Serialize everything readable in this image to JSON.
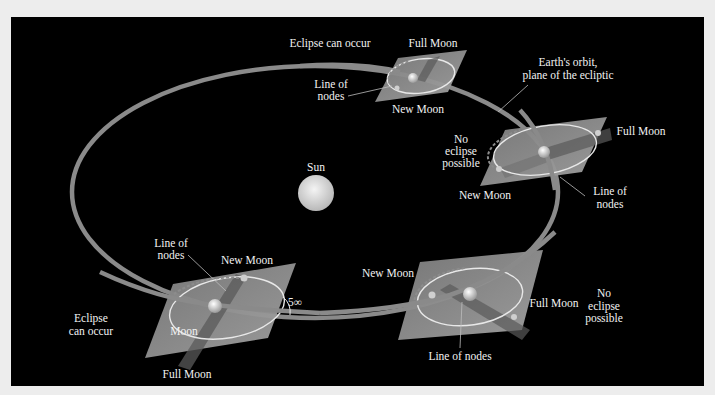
{
  "diagram": {
    "colors": {
      "background": "#ededed",
      "panel": "#000000",
      "orbit": "#8a8a8a",
      "plane": "#8c8c8c",
      "label": "#f2f2f2"
    },
    "sun": {
      "label": "Sun"
    },
    "orbit_label": {
      "line1": "Earth's orbit,",
      "line2": "plane of the ecliptic"
    },
    "angle_label": "5∞",
    "panels": [
      {
        "id": "top",
        "situation": "Eclipse can occur",
        "full_moon": "Full Moon",
        "new_moon": "New Moon",
        "nodes_line1": "Line of",
        "nodes_line2": "nodes"
      },
      {
        "id": "right",
        "situation_line1": "No",
        "situation_line2": "eclipse",
        "situation_line3": "possible",
        "full_moon": "Full Moon",
        "new_moon": "New Moon",
        "nodes_line1": "Line of",
        "nodes_line2": "nodes"
      },
      {
        "id": "bottom-left",
        "situation_line1": "Eclipse",
        "situation_line2": "can occur",
        "full_moon": "Full Moon",
        "new_moon": "New Moon",
        "moon": "Moon",
        "nodes_line1": "Line of",
        "nodes_line2": "nodes"
      },
      {
        "id": "bottom-right",
        "situation_line1": "No",
        "situation_line2": "eclipse",
        "situation_line3": "possible",
        "full_moon": "Full Moon",
        "new_moon": "New Moon",
        "nodes": "Line of nodes"
      }
    ]
  }
}
